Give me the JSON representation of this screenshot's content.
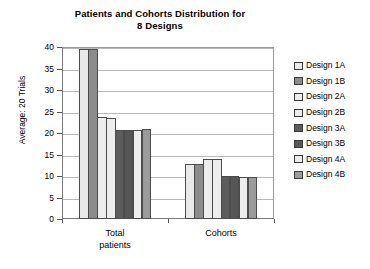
{
  "chart_data": {
    "type": "bar",
    "title": "Patients and Cohorts Distribution for 8 Designs",
    "title_lines": [
      "Patients and Cohorts Distribution for",
      "8 Designs"
    ],
    "xlabel": "",
    "ylabel": "Average: 20 Trials",
    "ylim": [
      0,
      40
    ],
    "yticks": [
      0,
      5,
      10,
      15,
      20,
      25,
      30,
      35,
      40
    ],
    "ytick_labels": [
      "0",
      "5",
      "10",
      "15",
      "20",
      "25",
      "30",
      "35",
      "40"
    ],
    "grid": true,
    "grid_axis": "y",
    "legend_position": "right",
    "categories": [
      "Total patients",
      "Cohorts"
    ],
    "category_label_lines": [
      [
        "Total",
        "patients"
      ],
      [
        "Cohorts"
      ]
    ],
    "series": [
      {
        "name": "Design 1A",
        "color": "#e9e9e9",
        "values": [
          39.6,
          12.8
        ]
      },
      {
        "name": "Design 1B",
        "color": "#8c8c8c",
        "values": [
          39.6,
          12.8
        ]
      },
      {
        "name": "Design 2A",
        "color": "#ededed",
        "values": [
          23.7,
          13.9
        ]
      },
      {
        "name": "Design 2B",
        "color": "#ededed",
        "values": [
          23.6,
          13.9
        ]
      },
      {
        "name": "Design 3A",
        "color": "#5c5c5c",
        "values": [
          20.6,
          10.0
        ]
      },
      {
        "name": "Design 3B",
        "color": "#565656",
        "values": [
          20.6,
          10.0
        ]
      },
      {
        "name": "Design 4A",
        "color": "#ededed",
        "values": [
          20.6,
          9.8
        ]
      },
      {
        "name": "Design 4B",
        "color": "#9b9b9b",
        "values": [
          20.9,
          9.8
        ]
      }
    ]
  },
  "legend": {
    "items": [
      {
        "label": "Design 1A",
        "color": "#e9e9e9"
      },
      {
        "label": "Design 1B",
        "color": "#8c8c8c"
      },
      {
        "label": "Design 2A",
        "color": "#ededed"
      },
      {
        "label": "Design 2B",
        "color": "#ededed"
      },
      {
        "label": "Design 3A",
        "color": "#5c5c5c"
      },
      {
        "label": "Design 3B",
        "color": "#565656"
      },
      {
        "label": "Design 4A",
        "color": "#ededed"
      },
      {
        "label": "Design 4B",
        "color": "#9b9b9b"
      }
    ]
  }
}
